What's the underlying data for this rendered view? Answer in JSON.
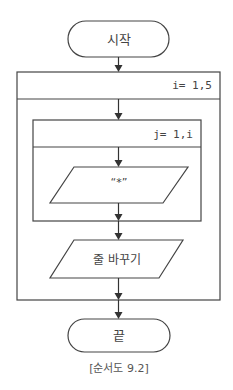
{
  "flowchart": {
    "start": {
      "label": "시작"
    },
    "outer_loop": {
      "label": "i= 1,5"
    },
    "inner_loop": {
      "label": "j= 1,i"
    },
    "output_star": {
      "label": "“*”"
    },
    "newline": {
      "label": "줄 바꾸기"
    },
    "end": {
      "label": "끝"
    }
  },
  "caption": "[순서도 9.2]",
  "colors": {
    "stroke": "#333333",
    "text": "#444444",
    "background": "#ffffff"
  }
}
